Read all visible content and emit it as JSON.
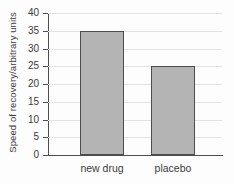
{
  "chart_data": {
    "type": "bar",
    "categories": [
      "new drug",
      "placebo"
    ],
    "values": [
      35,
      25
    ],
    "title": "",
    "xlabel": "",
    "ylabel": "Speed of recovery/arbitrary units",
    "ylim": [
      0,
      40
    ],
    "ytick_step": 5,
    "ytick_labels": [
      "0",
      "5",
      "10",
      "15",
      "20",
      "25",
      "30",
      "35",
      "40"
    ],
    "grid": true,
    "legend": false,
    "colors": {
      "bar_fill": "#b4b4b4",
      "bar_border": "#4d4d4d",
      "axis": "#4d4d4d",
      "gridline": "#e3e3e3",
      "text": "#3b3b3b",
      "background": "#fdfdfd"
    }
  }
}
